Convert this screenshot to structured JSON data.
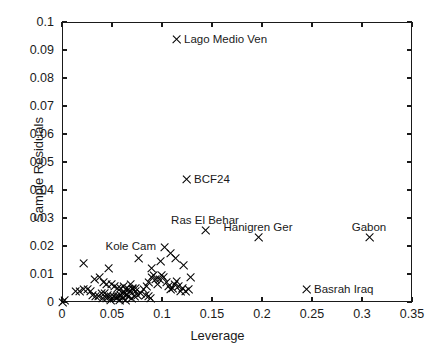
{
  "chart_data": {
    "type": "scatter",
    "title": "",
    "xlabel": "Leverage",
    "ylabel": "Sample Residuals",
    "xlim": [
      0,
      0.35
    ],
    "ylim": [
      0,
      0.1
    ],
    "xticks": [
      "0",
      "0.05",
      "0.1",
      "0.15",
      "0.2",
      "0.25",
      "0.3",
      "0.35"
    ],
    "xtickvalues": [
      0,
      0.05,
      0.1,
      0.15,
      0.2,
      0.25,
      0.3,
      0.35
    ],
    "yticks": [
      "0",
      "0.01",
      "0.02",
      "0.03",
      "0.04",
      "0.05",
      "0.06",
      "0.07",
      "0.08",
      "0.09",
      "0.1"
    ],
    "ytickvalues": [
      0,
      0.01,
      0.02,
      0.03,
      0.04,
      0.05,
      0.06,
      0.07,
      0.08,
      0.09,
      0.1
    ],
    "grid": false,
    "legend": null,
    "marker": "x",
    "marker_color": "#000000",
    "annotations": [
      {
        "label": "Lago Medio Ven",
        "x": 0.114,
        "y": 0.0936,
        "position": "right"
      },
      {
        "label": "BCF24",
        "x": 0.124,
        "y": 0.0436,
        "position": "right"
      },
      {
        "label": "Ras El Behar",
        "x": 0.143,
        "y": 0.0257,
        "position": "above"
      },
      {
        "label": "Hanigren Ger",
        "x": 0.196,
        "y": 0.0232,
        "position": "above"
      },
      {
        "label": "Gabon",
        "x": 0.307,
        "y": 0.0232,
        "position": "above"
      },
      {
        "label": "Kole Cam",
        "x": 0.102,
        "y": 0.0196,
        "position": "left"
      },
      {
        "label": "Basrah Iraq",
        "x": 0.244,
        "y": 0.0043,
        "position": "right"
      }
    ],
    "points": [
      {
        "x": 0.114,
        "y": 0.0936
      },
      {
        "x": 0.124,
        "y": 0.0436
      },
      {
        "x": 0.143,
        "y": 0.0257
      },
      {
        "x": 0.196,
        "y": 0.0232
      },
      {
        "x": 0.307,
        "y": 0.0232
      },
      {
        "x": 0.102,
        "y": 0.0196
      },
      {
        "x": 0.244,
        "y": 0.0043
      },
      {
        "x": 0.021,
        "y": 0.0136
      },
      {
        "x": 0.046,
        "y": 0.0121
      },
      {
        "x": 0.076,
        "y": 0.0157
      },
      {
        "x": 0.089,
        "y": 0.0121
      },
      {
        "x": 0.098,
        "y": 0.0143
      },
      {
        "x": 0.108,
        "y": 0.0175
      },
      {
        "x": 0.113,
        "y": 0.0157
      },
      {
        "x": 0.121,
        "y": 0.0132
      },
      {
        "x": 0.032,
        "y": 0.0082
      },
      {
        "x": 0.037,
        "y": 0.0089
      },
      {
        "x": 0.041,
        "y": 0.0071
      },
      {
        "x": 0.044,
        "y": 0.0064
      },
      {
        "x": 0.049,
        "y": 0.0061
      },
      {
        "x": 0.052,
        "y": 0.0057
      },
      {
        "x": 0.055,
        "y": 0.005
      },
      {
        "x": 0.058,
        "y": 0.005
      },
      {
        "x": 0.061,
        "y": 0.0057
      },
      {
        "x": 0.063,
        "y": 0.0046
      },
      {
        "x": 0.066,
        "y": 0.0046
      },
      {
        "x": 0.068,
        "y": 0.0061
      },
      {
        "x": 0.07,
        "y": 0.005
      },
      {
        "x": 0.073,
        "y": 0.0039
      },
      {
        "x": 0.013,
        "y": 0.0039
      },
      {
        "x": 0.017,
        "y": 0.0039
      },
      {
        "x": 0.021,
        "y": 0.0043
      },
      {
        "x": 0.025,
        "y": 0.0043
      },
      {
        "x": 0.028,
        "y": 0.0036
      },
      {
        "x": 0.03,
        "y": 0.0025
      },
      {
        "x": 0.033,
        "y": 0.0021
      },
      {
        "x": 0.036,
        "y": 0.0021
      },
      {
        "x": 0.039,
        "y": 0.0029
      },
      {
        "x": 0.042,
        "y": 0.0029
      },
      {
        "x": 0.045,
        "y": 0.0025
      },
      {
        "x": 0.048,
        "y": 0.0021
      },
      {
        "x": 0.051,
        "y": 0.0018
      },
      {
        "x": 0.054,
        "y": 0.0018
      },
      {
        "x": 0.056,
        "y": 0.0021
      },
      {
        "x": 0.058,
        "y": 0.0025
      },
      {
        "x": 0.06,
        "y": 0.0029
      },
      {
        "x": 0.062,
        "y": 0.0032
      },
      {
        "x": 0.064,
        "y": 0.0025
      },
      {
        "x": 0.066,
        "y": 0.0018
      },
      {
        "x": 0.069,
        "y": 0.0014
      },
      {
        "x": 0.072,
        "y": 0.0018
      },
      {
        "x": 0.075,
        "y": 0.0025
      },
      {
        "x": 0.078,
        "y": 0.0032
      },
      {
        "x": 0.081,
        "y": 0.0046
      },
      {
        "x": 0.084,
        "y": 0.0057
      },
      {
        "x": 0.086,
        "y": 0.0071
      },
      {
        "x": 0.089,
        "y": 0.0086
      },
      {
        "x": 0.091,
        "y": 0.0093
      },
      {
        "x": 0.093,
        "y": 0.0079
      },
      {
        "x": 0.095,
        "y": 0.0064
      },
      {
        "x": 0.097,
        "y": 0.0079
      },
      {
        "x": 0.099,
        "y": 0.0096
      },
      {
        "x": 0.101,
        "y": 0.0086
      },
      {
        "x": 0.104,
        "y": 0.0071
      },
      {
        "x": 0.106,
        "y": 0.0057
      },
      {
        "x": 0.108,
        "y": 0.0046
      },
      {
        "x": 0.11,
        "y": 0.005
      },
      {
        "x": 0.112,
        "y": 0.0064
      },
      {
        "x": 0.114,
        "y": 0.0075
      },
      {
        "x": 0.116,
        "y": 0.0057
      },
      {
        "x": 0.118,
        "y": 0.0039
      },
      {
        "x": 0.12,
        "y": 0.005
      },
      {
        "x": 0.123,
        "y": 0.0036
      },
      {
        "x": 0.126,
        "y": 0.0046
      },
      {
        "x": 0.128,
        "y": 0.0086
      },
      {
        "x": 0.083,
        "y": 0.0025
      },
      {
        "x": 0.086,
        "y": 0.0018
      },
      {
        "x": 0.088,
        "y": 0.0011
      },
      {
        "x": 0.054,
        "y": 0.0011
      },
      {
        "x": 0.057,
        "y": 0.0007
      },
      {
        "x": 0.06,
        "y": 0.0011
      },
      {
        "x": 0.063,
        "y": 0.0007
      },
      {
        "x": 0.048,
        "y": 0.0007
      },
      {
        "x": 0.044,
        "y": 0.0011
      },
      {
        "x": 0.04,
        "y": 0.0014
      },
      {
        "x": 0.067,
        "y": 0.0036
      },
      {
        "x": 0.07,
        "y": 0.0043
      },
      {
        "x": 0.073,
        "y": 0.005
      },
      {
        "x": 0.0,
        "y": 0.0
      },
      {
        "x": 0.002,
        "y": 0.0004
      }
    ]
  }
}
